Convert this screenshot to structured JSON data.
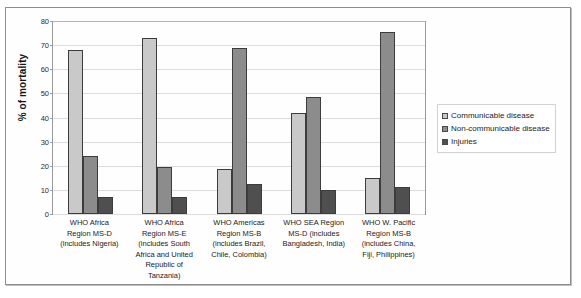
{
  "chart_data": {
    "type": "bar",
    "title": "",
    "xlabel": "",
    "ylabel": "% of mortality",
    "ylim": [
      0,
      80
    ],
    "yticks": [
      0,
      10,
      20,
      30,
      40,
      50,
      60,
      70,
      80
    ],
    "grid": true,
    "legend_position": "right",
    "categories": [
      "WHO Africa Region MS-D (includes Nigeria)",
      "WHO Africa Region MS-E (includes South Africa and United Republic of Tanzania)",
      "WHO Americas Region MS-B (includes Brazil, Chile, Colombia)",
      "WHO SEA Region MS-D (includes Bangladesh, India)",
      "WHO W. Pacific Region MS-B (includes China, Fiji, Philippines)"
    ],
    "category_lines": [
      [
        "WHO Africa",
        "Region MS-D",
        "(includes Nigeria)"
      ],
      [
        "WHO Africa",
        "Region MS-E",
        "(includes South",
        "Africa and United",
        "Republic of",
        "Tanzania)"
      ],
      [
        "WHO Americas",
        "Region MS-B",
        "(includes Brazil,",
        "Chile, Colombia)"
      ],
      [
        "WHO SEA Region",
        "MS-D (includes",
        "Bangladesh, India)"
      ],
      [
        "WHO W. Pacific",
        "Region MS-B",
        "(includes China,",
        "Fiji, Philippines)"
      ]
    ],
    "series": [
      {
        "name": "Communicable disease",
        "color": "#c9c9c9",
        "values": [
          68,
          73,
          18.5,
          42,
          15
        ]
      },
      {
        "name": "Non-communicable disease",
        "color": "#8c8c8c",
        "values": [
          24,
          19.5,
          69,
          48.5,
          75.5
        ]
      },
      {
        "name": "Injuries",
        "color": "#4f4f4f",
        "values": [
          7,
          7,
          12.5,
          10,
          11
        ]
      }
    ]
  },
  "legend": {
    "items": [
      {
        "label": "Communicable disease",
        "color": "#c9c9c9"
      },
      {
        "label": "Non-communicable disease",
        "color": "#8c8c8c"
      },
      {
        "label": "Injuries",
        "color": "#4f4f4f"
      }
    ]
  },
  "axis": {
    "y_title": "% of mortality"
  }
}
